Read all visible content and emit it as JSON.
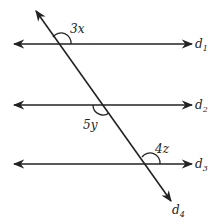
{
  "diagram": {
    "lines": [
      {
        "id": "d1",
        "label": "d",
        "subscript": "1"
      },
      {
        "id": "d2",
        "label": "d",
        "subscript": "2"
      },
      {
        "id": "d3",
        "label": "d",
        "subscript": "3"
      },
      {
        "id": "d4",
        "label": "d",
        "subscript": "4"
      }
    ],
    "angles": [
      {
        "label": "3x",
        "at": "d1"
      },
      {
        "label": "5y",
        "at": "d2"
      },
      {
        "label": "4z",
        "at": "d3"
      }
    ],
    "colors": {
      "stroke": "#222222",
      "background": "#ffffff"
    }
  }
}
